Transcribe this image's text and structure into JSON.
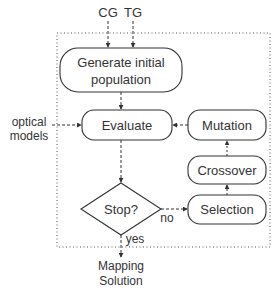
{
  "inputs": {
    "cg": "CG",
    "tg": "TG",
    "optical_line1": "optical",
    "optical_line2": "models"
  },
  "nodes": {
    "generate_line1": "Generate initial",
    "generate_line2": "population",
    "evaluate": "Evaluate",
    "mutation": "Mutation",
    "crossover": "Crossover",
    "selection": "Selection",
    "stop": "Stop?"
  },
  "edges": {
    "no": "no",
    "yes": "yes"
  },
  "output": {
    "line1": "Mapping",
    "line2": "Solution"
  },
  "colors": {
    "stroke": "#333333",
    "dotted_border": "#555555",
    "background": "#ffffff"
  }
}
